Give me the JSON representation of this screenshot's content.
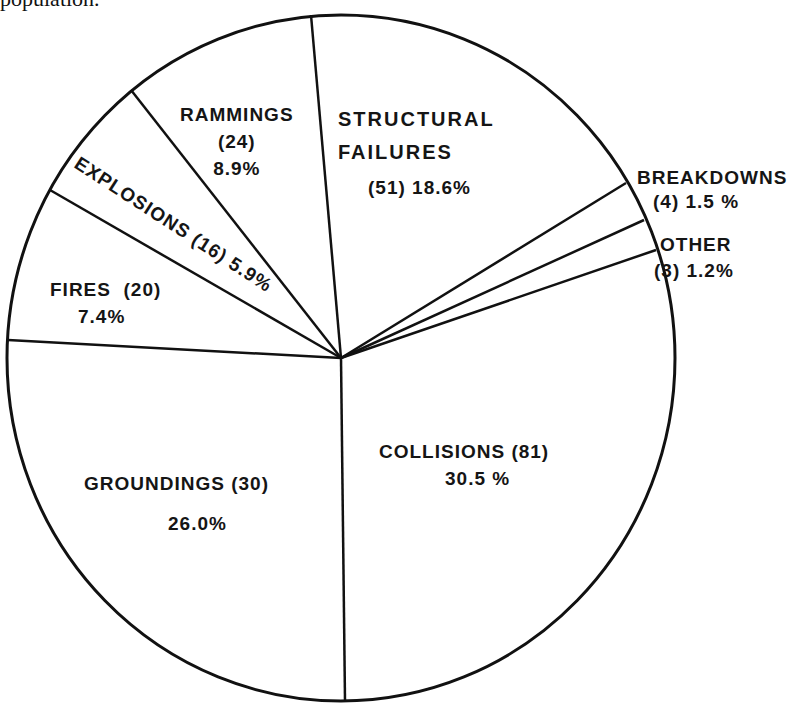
{
  "header": {
    "caption_fragment": "population."
  },
  "chart_data": {
    "type": "pie",
    "title": "",
    "total_note": "Casualty categories with counts and percentages",
    "slices": [
      {
        "label": "STRUCTURAL FAILURES",
        "count": 51,
        "percent": 18.6
      },
      {
        "label": "BREAKDOWNS",
        "count": 4,
        "percent": 1.5
      },
      {
        "label": "OTHER",
        "count": 3,
        "percent": 1.2
      },
      {
        "label": "COLLISIONS",
        "count": 81,
        "percent": 30.5
      },
      {
        "label": "GROUNDINGS",
        "count": 30,
        "percent": 26.0
      },
      {
        "label": "FIRES",
        "count": 20,
        "percent": 7.4
      },
      {
        "label": "EXPLOSIONS",
        "count": 16,
        "percent": 5.9
      },
      {
        "label": "RAMMINGS",
        "count": 24,
        "percent": 8.9
      }
    ],
    "legend": "none (labels placed inside/next to slices)",
    "colors": {
      "fill": "#ffffff",
      "stroke": "#111111"
    }
  },
  "labels": {
    "rammings": {
      "l1": "RAMMINGS",
      "l2": "(24)",
      "l3": "8.9%"
    },
    "structural": {
      "l1": "STRUCTURAL",
      "l2": "FAILURES",
      "l3": "(51) 18.6%"
    },
    "breakdowns": {
      "l1": "BREAKDOWNS",
      "l2": "(4) 1.5 %"
    },
    "other": {
      "l1": "OTHER",
      "l2": "(3) 1.2%"
    },
    "explosions": {
      "l1": "EXPLOSIONS (16) 5.9%"
    },
    "fires": {
      "l1": "FIRES  (20)",
      "l2": "7.4%"
    },
    "groundings": {
      "l1": "GROUNDINGS (30)",
      "l2": "26.0%"
    },
    "collisions": {
      "l1": "COLLISIONS (81)",
      "l2": "30.5 %"
    }
  },
  "geometry": {
    "cx": 341,
    "cy": 358,
    "rx": 334,
    "ry": 343,
    "dividers": [
      [
        311,
        15
      ],
      [
        626,
        183
      ],
      [
        644,
        220
      ],
      [
        656,
        250
      ],
      [
        345,
        700
      ],
      [
        8,
        340
      ],
      [
        50,
        190
      ],
      [
        131,
        90
      ]
    ]
  }
}
